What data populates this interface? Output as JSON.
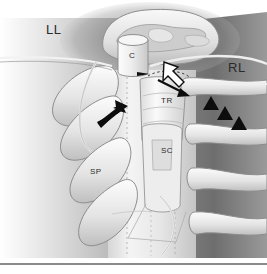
{
  "figure": {
    "domain": "anatomical-illustration",
    "width": 267,
    "height": 274,
    "style": "grayscale medical illustration, airbrush shading"
  },
  "labels": [
    {
      "id": "LL",
      "text": "LL",
      "meaning": "left lung",
      "size": "large",
      "x": 46,
      "y": 22
    },
    {
      "id": "RL",
      "text": "RL",
      "meaning": "right lung",
      "size": "large",
      "x": 228,
      "y": 60
    },
    {
      "id": "C",
      "text": "C",
      "meaning": "cartilage / carina",
      "size": "small",
      "x": 129,
      "y": 51
    },
    {
      "id": "TR",
      "text": "TR",
      "meaning": "trachea",
      "size": "small",
      "x": 161,
      "y": 96
    },
    {
      "id": "SC",
      "text": "SC",
      "meaning": "spinal cord",
      "size": "small",
      "x": 161,
      "y": 146
    },
    {
      "id": "SP",
      "text": "SP",
      "meaning": "spinous process",
      "size": "small",
      "x": 90,
      "y": 167
    }
  ],
  "markers": {
    "white_open_arrow": {
      "name": "white-open-arrow",
      "count": 1,
      "fill": "#ffffff",
      "stroke": "#111111",
      "direction": "up-left",
      "x": 172,
      "y": 70
    },
    "black_solid_arrows": [
      {
        "name": "black-arrow-left",
        "direction": "up-right",
        "x": 110,
        "y": 116,
        "size": "large"
      },
      {
        "name": "black-arrow-right",
        "direction": "right",
        "x": 178,
        "y": 90,
        "size": "thin"
      }
    ],
    "black_arrowheads": {
      "name": "black-arrowhead-triangle",
      "count": 3,
      "fill": "#0d0d0d",
      "arrangement": "diagonal descending row",
      "points": [
        {
          "x": 211,
          "y": 104
        },
        {
          "x": 224,
          "y": 113
        },
        {
          "x": 237,
          "y": 123
        }
      ]
    }
  },
  "colors": {
    "background": "#ffffff",
    "dark_field": "#6f6f6f",
    "mid_gray": "#b9b9b9",
    "light_structure": "#e9e9e9",
    "outline": "#7d7d7d",
    "marker_black": "#0d0d0d",
    "marker_white": "#ffffff",
    "rule": "#8a8a8a",
    "text": "#2b2b2b"
  },
  "bottom_rule": {
    "name": "horizontal-divider",
    "y": 263,
    "thickness": 2,
    "color": "#8a8a8a"
  }
}
